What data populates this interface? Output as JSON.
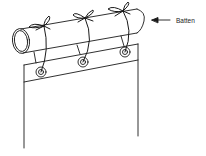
{
  "diagram": {
    "type": "illustration",
    "labels": {
      "batten": "Batten"
    },
    "components": {
      "batten": "cylindrical rod",
      "ties": 3,
      "eyelets": 3,
      "curtain": "hanging fabric panel"
    },
    "colors": {
      "stroke": "#1a1a1a",
      "background": "#ffffff"
    }
  }
}
